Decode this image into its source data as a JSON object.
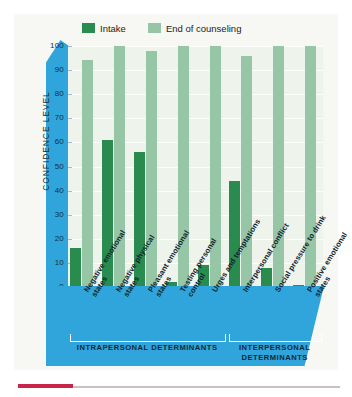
{
  "chart_data": {
    "type": "bar",
    "title": "",
    "xlabel": "",
    "ylabel": "CONFIDENCE LEVEL",
    "ylim": [
      0,
      100
    ],
    "yticks": [
      0,
      10,
      20,
      30,
      40,
      50,
      60,
      70,
      80,
      90,
      100
    ],
    "grid": true,
    "legend_position": "top",
    "categories": [
      "Negative emotional states",
      "Negative physical states",
      "Pleasant emotional states",
      "Testing personal control",
      "Urges and temptations",
      "Interpersonal conflict",
      "Social pressure to drink",
      "Positive emotional states"
    ],
    "series": [
      {
        "name": "Intake",
        "color": "#2a8b4e",
        "values": [
          16,
          61,
          56,
          2,
          9,
          44,
          8,
          1
        ]
      },
      {
        "name": "End of counseling",
        "color": "#97c6a6",
        "values": [
          94,
          100,
          98,
          100,
          100,
          96,
          100,
          100
        ]
      }
    ],
    "groups": [
      {
        "label": "INTRAPERSONAL DETERMINANTS",
        "categories": [
          0,
          1,
          2,
          3,
          4
        ]
      },
      {
        "label": "INTERPERSONAL DETERMINANTS",
        "categories": [
          5,
          6,
          7
        ]
      }
    ]
  },
  "colors": {
    "panel_blue": "#2fa5dc",
    "plot_background": "#eef3ec",
    "intake": "#2a8b4e",
    "end_of_counseling": "#97c6a6",
    "accent_rule": "#c9254b"
  }
}
